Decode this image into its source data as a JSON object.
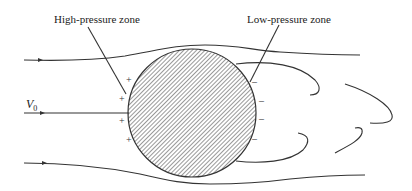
{
  "labels": {
    "high_pressure": "High-pressure zone",
    "low_pressure": "Low-pressure zone",
    "velocity_symbol": "V",
    "velocity_subscript": "0"
  },
  "signs": {
    "plus": [
      "+",
      "+",
      "+",
      "+"
    ],
    "minus": [
      "–",
      "–",
      "–",
      "–"
    ]
  },
  "colors": {
    "stroke": "#333333",
    "hatch": "#444444",
    "background": "#ffffff"
  }
}
